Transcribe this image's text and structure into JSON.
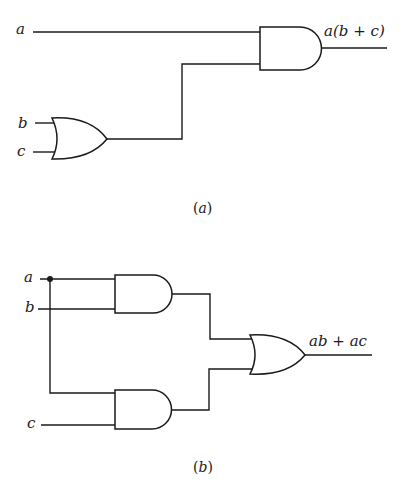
{
  "diagram": {
    "type": "logic-circuit",
    "colors": {
      "line": "#1a1a1a",
      "background": "#ffffff"
    },
    "circuit_a": {
      "caption": "(a)",
      "inputs": [
        "a",
        "b",
        "c"
      ],
      "gates": [
        {
          "id": "or1",
          "type": "OR",
          "inputs": [
            "b",
            "c"
          ]
        },
        {
          "id": "and1",
          "type": "AND",
          "inputs": [
            "a",
            "or1"
          ]
        }
      ],
      "output_label": "a(b + c)"
    },
    "circuit_b": {
      "caption": "(b)",
      "inputs": [
        "a",
        "b",
        "c"
      ],
      "gates": [
        {
          "id": "and1",
          "type": "AND",
          "inputs": [
            "a",
            "b"
          ]
        },
        {
          "id": "and2",
          "type": "AND",
          "inputs": [
            "a",
            "c"
          ]
        },
        {
          "id": "or1",
          "type": "OR",
          "inputs": [
            "and1",
            "and2"
          ]
        }
      ],
      "output_label": "ab + ac"
    },
    "labels": {
      "a_top": "a",
      "b_top": "b",
      "c_top": "c",
      "a_bottom": "a",
      "b_bottom": "b",
      "c_bottom": "c",
      "caption_a_letter": "a",
      "caption_b_letter": "b",
      "out_a": "a(b + c)",
      "out_b": "ab + ac"
    }
  }
}
